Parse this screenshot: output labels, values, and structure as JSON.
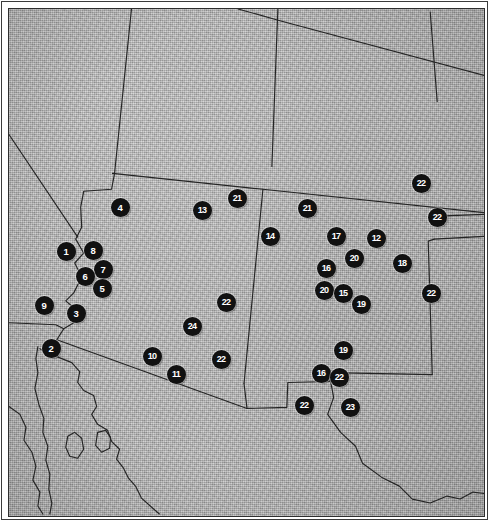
{
  "figure": {
    "name": "southwest-archaeological-site-map",
    "kind": "map",
    "region": "American Southwest / Northern Mexico",
    "background_color": "#b6b6b6",
    "border_color": "#2e2e2e",
    "marker_fill": "#111111",
    "marker_text_color": "#ffffff"
  },
  "markers": [
    {
      "label": "4",
      "x": 118,
      "y": 205
    },
    {
      "label": "13",
      "x": 200,
      "y": 208
    },
    {
      "label": "21",
      "x": 235,
      "y": 196
    },
    {
      "label": "21",
      "x": 305,
      "y": 206
    },
    {
      "label": "22",
      "x": 419,
      "y": 181
    },
    {
      "label": "22",
      "x": 435,
      "y": 215
    },
    {
      "label": "14",
      "x": 268,
      "y": 234
    },
    {
      "label": "17",
      "x": 334,
      "y": 234
    },
    {
      "label": "12",
      "x": 374,
      "y": 236
    },
    {
      "label": "1",
      "x": 64,
      "y": 249
    },
    {
      "label": "8",
      "x": 91,
      "y": 248
    },
    {
      "label": "7",
      "x": 101,
      "y": 267
    },
    {
      "label": "6",
      "x": 83,
      "y": 274
    },
    {
      "label": "5",
      "x": 100,
      "y": 286
    },
    {
      "label": "16",
      "x": 324,
      "y": 266
    },
    {
      "label": "20",
      "x": 352,
      "y": 256
    },
    {
      "label": "18",
      "x": 400,
      "y": 261
    },
    {
      "label": "20",
      "x": 322,
      "y": 288
    },
    {
      "label": "15",
      "x": 341,
      "y": 291
    },
    {
      "label": "19",
      "x": 359,
      "y": 302
    },
    {
      "label": "22",
      "x": 429,
      "y": 291
    },
    {
      "label": "9",
      "x": 42,
      "y": 303
    },
    {
      "label": "3",
      "x": 74,
      "y": 311
    },
    {
      "label": "22",
      "x": 224,
      "y": 300
    },
    {
      "label": "24",
      "x": 190,
      "y": 324
    },
    {
      "label": "2",
      "x": 49,
      "y": 346
    },
    {
      "label": "10",
      "x": 150,
      "y": 354
    },
    {
      "label": "22",
      "x": 219,
      "y": 357
    },
    {
      "label": "11",
      "x": 174,
      "y": 372
    },
    {
      "label": "19",
      "x": 341,
      "y": 348
    },
    {
      "label": "16",
      "x": 319,
      "y": 371
    },
    {
      "label": "22",
      "x": 337,
      "y": 375
    },
    {
      "label": "22",
      "x": 302,
      "y": 403
    },
    {
      "label": "23",
      "x": 348,
      "y": 405
    }
  ],
  "boundaries": [
    {
      "name": "nevada-utah-vertical",
      "d": "M 130,7 L 113,172"
    },
    {
      "name": "utah-arizona-east-leg",
      "d": "M 113,172 L 111,172"
    },
    {
      "name": "utah-colorado-vertical",
      "d": "M 277,7 L 271,165"
    },
    {
      "name": "wyoming-south-to-colorado",
      "d": "M 237,7 L 280,19 L 489,75"
    },
    {
      "name": "nebraska-kansas-vertical",
      "d": "M 430,10 L 437,100"
    },
    {
      "name": "colorado-newmexico-south",
      "d": "M 111,172 L 262,188 L 489,212"
    },
    {
      "name": "california-nevada-diagonal",
      "d": "M 7,133 L 76,236"
    },
    {
      "name": "colorado-river-border",
      "d": "M 113,172 L 110,188 L 82,190 L 79,206 L 80,226 L 74,238 L 82,252 L 73,262 L 80,276 L 72,292 L 64,300 L 78,312 L 72,322 L 62,328 L 55,339"
    },
    {
      "name": "california-arizona-south-border",
      "d": "M 7,322 L 54,324 L 62,328"
    },
    {
      "name": "mexico-usa-border-west",
      "d": "M 55,339 L 246,408"
    },
    {
      "name": "newmexico-arizona-vertical",
      "d": "M 262,188 L 243,383"
    },
    {
      "name": "arizona-newmexico-south-step",
      "d": "M 243,383 L 246,408"
    },
    {
      "name": "newmexico-south-border",
      "d": "M 246,408 L 286,407 L 287,382 L 329,381 L 330,372 L 432,374"
    },
    {
      "name": "texas-panhandle-west",
      "d": "M 432,374 L 428,240 L 434,238"
    },
    {
      "name": "oklahoma-texas-north",
      "d": "M 434,238 L 489,235"
    },
    {
      "name": "oklahoma-panhandle-north",
      "d": "M 437,215 L 489,213"
    },
    {
      "name": "rio-grande",
      "d": "M 330,381 L 333,397 L 327,414 L 340,432 L 355,446 L 362,463 L 381,477 L 399,486 L 412,499 L 430,503 L 447,496 L 460,499 L 473,492 L 489,494"
    },
    {
      "name": "baja-gulf-coast-east",
      "d": "M 38,348 L 45,352 L 70,362 L 78,371 L 76,382 L 82,390 L 92,395 L 95,406 L 90,414 L 96,424 L 106,430 L 110,441 L 118,449 L 115,459 L 122,468 L 127,478 L 134,486 L 140,498 L 150,507 L 158,514"
    },
    {
      "name": "baja-peninsula-west",
      "d": "M 36,346 L 34,358 L 36,372 L 33,388 L 37,404 L 42,418 L 41,432 L 46,446 L 44,460 L 48,474 L 47,489 L 50,503 L 48,514"
    },
    {
      "name": "gulf-west-coast-mainland",
      "d": "M 7,406 L 18,414 L 24,427 L 22,440 L 30,452 L 34,466 L 31,480 L 38,492 L 36,506 L 41,514"
    },
    {
      "name": "island-tiburon",
      "d": "M 66,436 L 73,432 L 80,438 L 82,449 L 76,458 L 68,456 L 64,447 Z"
    },
    {
      "name": "island-angel-de-la-guarda",
      "d": "M 96,432 L 104,430 L 109,437 L 108,448 L 100,452 L 94,445 Z"
    }
  ]
}
